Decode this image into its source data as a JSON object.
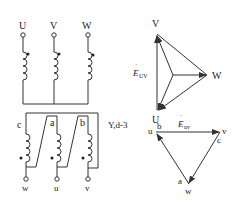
{
  "primary": {
    "terminals": [
      {
        "label": "U",
        "x": 23
      },
      {
        "label": "V",
        "x": 54
      },
      {
        "label": "W",
        "x": 88
      }
    ],
    "connection": "Y (star)"
  },
  "secondary": {
    "windings": [
      {
        "label": "c",
        "x": 26
      },
      {
        "label": "a",
        "x": 57
      },
      {
        "label": "b",
        "x": 88
      }
    ],
    "terminals": [
      {
        "label": "w",
        "x": 26
      },
      {
        "label": "u",
        "x": 57
      },
      {
        "label": "v",
        "x": 88
      }
    ],
    "connection": "d (delta)"
  },
  "connection_group": "Y,d-3",
  "phasor_primary": {
    "vertices": {
      "V": "V",
      "W": "W",
      "U": "U"
    },
    "emf_label": "E",
    "emf_subscript": "UV"
  },
  "phasor_secondary": {
    "vertex_labels": {
      "top_left": [
        "u",
        "b"
      ],
      "top_right": [
        "v",
        "c"
      ],
      "bottom": [
        "a",
        "w"
      ]
    },
    "emf_label": "E",
    "emf_subscript": "uv"
  },
  "colors": {
    "line": "#333333",
    "text": "#222222",
    "background": "#ffffff"
  }
}
